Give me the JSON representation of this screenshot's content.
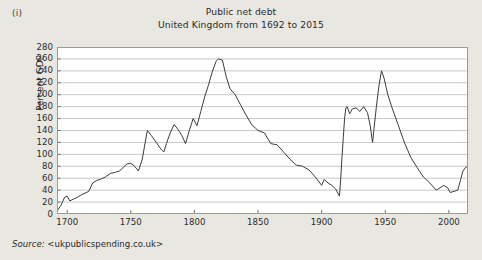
{
  "figure": {
    "label": "(i)",
    "source_prefix": "Source:",
    "source_value": "<ukpublicspending.co.uk>",
    "background_color": "#e9e7e2",
    "plot_background_color": "#ffffff",
    "grid_color": "#c8c8c8",
    "line_color": "#3c3c3c",
    "axis_color": "#8a8a8a"
  },
  "chart_data": {
    "type": "line",
    "title": "Public net debt",
    "subtitle": "United Kingdom from 1692 to 2015",
    "title_lines": [
      "Public net debt",
      "United Kingdom from 1692 to 2015"
    ],
    "xlabel": "",
    "ylabel": "Percent GDP",
    "xlim": [
      1692,
      2015
    ],
    "ylim": [
      0,
      280
    ],
    "grid": true,
    "grid_axis": "y",
    "legend": false,
    "xticks": [
      1700,
      1750,
      1800,
      1850,
      1900,
      1950,
      2000
    ],
    "xtick_labels": [
      "1700",
      "1750",
      "1800",
      "1850",
      "1900",
      "1950",
      "2000"
    ],
    "yticks": [
      0,
      20,
      40,
      60,
      80,
      100,
      120,
      140,
      160,
      180,
      200,
      220,
      240,
      260,
      280
    ],
    "ytick_labels": [
      "0",
      "20",
      "40",
      "60",
      "80",
      "100",
      "120",
      "140",
      "160",
      "180",
      "200",
      "220",
      "240",
      "260",
      "280"
    ],
    "series": [
      {
        "name": "Public net debt (percent GDP)",
        "x": [
          1692,
          1695,
          1698,
          1700,
          1702,
          1705,
          1708,
          1711,
          1714,
          1717,
          1720,
          1723,
          1726,
          1730,
          1734,
          1738,
          1741,
          1744,
          1747,
          1750,
          1753,
          1756,
          1759,
          1763,
          1766,
          1770,
          1774,
          1776,
          1778,
          1781,
          1784,
          1787,
          1790,
          1793,
          1796,
          1799,
          1802,
          1805,
          1808,
          1811,
          1814,
          1817,
          1819,
          1822,
          1825,
          1828,
          1832,
          1836,
          1840,
          1845,
          1850,
          1855,
          1860,
          1865,
          1870,
          1875,
          1880,
          1885,
          1890,
          1895,
          1900,
          1902,
          1905,
          1908,
          1911,
          1914,
          1915,
          1916,
          1917,
          1918,
          1919,
          1920,
          1922,
          1924,
          1927,
          1930,
          1933,
          1936,
          1938,
          1940,
          1941,
          1943,
          1945,
          1947,
          1949,
          1952,
          1955,
          1960,
          1965,
          1970,
          1975,
          1980,
          1985,
          1990,
          1993,
          1996,
          1999,
          2001,
          2004,
          2007,
          2009,
          2011,
          2013,
          2015
        ],
        "y": [
          5,
          14,
          28,
          30,
          22,
          25,
          28,
          32,
          35,
          38,
          52,
          56,
          58,
          62,
          68,
          70,
          72,
          78,
          84,
          85,
          80,
          72,
          92,
          140,
          132,
          120,
          108,
          104,
          118,
          136,
          150,
          142,
          132,
          118,
          140,
          160,
          148,
          172,
          196,
          216,
          238,
          256,
          260,
          258,
          230,
          210,
          200,
          184,
          168,
          150,
          140,
          136,
          118,
          116,
          104,
          92,
          82,
          80,
          74,
          62,
          48,
          58,
          52,
          48,
          42,
          30,
          60,
          96,
          128,
          160,
          178,
          180,
          168,
          176,
          178,
          172,
          180,
          170,
          150,
          120,
          140,
          180,
          215,
          240,
          228,
          200,
          180,
          150,
          120,
          95,
          78,
          62,
          52,
          40,
          44,
          48,
          44,
          36,
          38,
          40,
          56,
          72,
          78,
          80
        ],
        "color": "#3c3c3c"
      }
    ],
    "annotations": [
      {
        "label": "Napoleonic Wars peak",
        "year": 1819,
        "value": 260
      },
      {
        "label": "Post WWII peak",
        "year": 1947,
        "value": 240
      },
      {
        "label": "WWI plateau",
        "year": 1920,
        "value": 180
      },
      {
        "label": "Pre-WWI low",
        "year": 1914,
        "value": 30
      },
      {
        "label": "End of series",
        "year": 2015,
        "value": 80
      }
    ]
  }
}
